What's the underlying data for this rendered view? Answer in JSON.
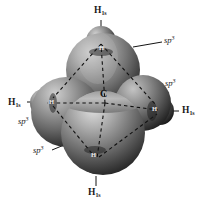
{
  "figure": {
    "background_color": "#ffffff",
    "width": 209,
    "height": 208
  },
  "center_atom": {
    "label": "C",
    "name": "carbon",
    "x": 105,
    "y": 103
  },
  "hydrogen_labels": [
    {
      "id": "h-top",
      "element": "H",
      "subscript": "1s",
      "x": 94,
      "y": 6,
      "position": "top"
    },
    {
      "id": "h-left",
      "element": "H",
      "subscript": "1s",
      "x": 8,
      "y": 98,
      "position": "left"
    },
    {
      "id": "h-right",
      "element": "H",
      "subscript": "1s",
      "x": 178,
      "y": 108,
      "position": "right"
    },
    {
      "id": "h-bottom",
      "element": "H",
      "subscript": "1s",
      "x": 88,
      "y": 189,
      "position": "bottom"
    }
  ],
  "orbital_labels": [
    {
      "id": "sp3-upper-right",
      "base": "sp",
      "exponent": "3",
      "x": 163,
      "y": 40,
      "position": "upper-right"
    },
    {
      "id": "sp3-mid-right",
      "base": "sp",
      "exponent": "3",
      "x": 163,
      "y": 83,
      "position": "mid-right"
    },
    {
      "id": "sp3-mid-left",
      "base": "sp",
      "exponent": "3",
      "x": 18,
      "y": 122,
      "position": "mid-left"
    },
    {
      "id": "sp3-lower-left",
      "base": "sp",
      "exponent": "3",
      "x": 32,
      "y": 151,
      "position": "lower-left"
    }
  ],
  "inner_hydrogen_marks": [
    {
      "id": "hmark-top",
      "text": "H",
      "x": 99,
      "y": 48,
      "shade": "light"
    },
    {
      "id": "hmark-left",
      "text": "H",
      "x": 49,
      "y": 103,
      "shade": "light"
    },
    {
      "id": "hmark-right",
      "text": "H",
      "x": 152,
      "y": 110,
      "shade": "light"
    },
    {
      "id": "hmark-bottom",
      "text": "H",
      "x": 90,
      "y": 156,
      "shade": "light"
    }
  ],
  "colors": {
    "lobe_light": "#c9c9c9",
    "lobe_mid": "#8f8f8f",
    "lobe_dark": "#4a4a4a",
    "lobe_darkest": "#232323",
    "hydrogen_light": "#bdbdbd",
    "hydrogen_dark": "#2b2b2b",
    "bond_line": "#111111",
    "text": "#1a1a1a"
  },
  "geometry": {
    "description": "Tetrahedral methane with four sp3 hybrid orbital lobes overlapping four hydrogen 1s orbitals",
    "bond_style": "dashed",
    "spheres": [
      {
        "name": "sp3-lobe-top",
        "cx": 103,
        "cy": 70,
        "r": 37
      },
      {
        "name": "sp3-lobe-bottom",
        "cx": 103,
        "cy": 133,
        "r": 42
      },
      {
        "name": "sp3-lobe-left",
        "cx": 66,
        "cy": 112,
        "r": 35
      },
      {
        "name": "sp3-lobe-right",
        "cx": 143,
        "cy": 103,
        "r": 28
      },
      {
        "name": "h-sphere-top",
        "cx": 101,
        "cy": 41,
        "r": 15
      },
      {
        "name": "h-sphere-left",
        "cx": 44,
        "cy": 103,
        "r": 14
      },
      {
        "name": "h-sphere-right",
        "cx": 160,
        "cy": 111,
        "r": 14
      },
      {
        "name": "h-sphere-bottom",
        "cx": 96,
        "cy": 160,
        "r": 14
      }
    ]
  }
}
